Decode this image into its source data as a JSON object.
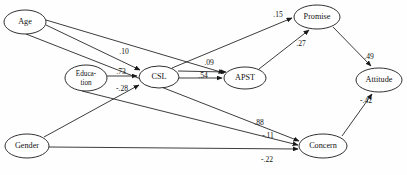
{
  "figure": {
    "type": "path-diagram",
    "caption": ""
  },
  "nodes": [
    {
      "id": "age",
      "label": "Age",
      "label_lines": [
        "Age"
      ],
      "cx": 25,
      "cy": 22,
      "rx": 21,
      "ry": 12
    },
    {
      "id": "education",
      "label": "Education",
      "label_lines": [
        "Educa-",
        "tion"
      ],
      "cx": 86,
      "cy": 78,
      "rx": 21,
      "ry": 13
    },
    {
      "id": "csl",
      "label": "CSL",
      "label_lines": [
        "CSL"
      ],
      "cx": 159,
      "cy": 77,
      "rx": 20,
      "ry": 11
    },
    {
      "id": "apst",
      "label": "APST",
      "label_lines": [
        "APST"
      ],
      "cx": 245,
      "cy": 78,
      "rx": 21,
      "ry": 11
    },
    {
      "id": "promise",
      "label": "Promise",
      "label_lines": [
        "Promise"
      ],
      "cx": 317,
      "cy": 17,
      "rx": 23,
      "ry": 12
    },
    {
      "id": "attitude",
      "label": "Attitude",
      "label_lines": [
        "Attitude"
      ],
      "cx": 379,
      "cy": 80,
      "rx": 23,
      "ry": 12
    },
    {
      "id": "concern",
      "label": "Concern",
      "label_lines": [
        "Concern"
      ],
      "cx": 323,
      "cy": 146,
      "rx": 24,
      "ry": 12
    },
    {
      "id": "gender",
      "label": "Gender",
      "label_lines": [
        "Gender"
      ],
      "cx": 27,
      "cy": 146,
      "rx": 22,
      "ry": 12
    }
  ],
  "edges": [
    {
      "id": "age-csl",
      "from": "Age",
      "to": "CSL",
      "coefficient": ".10",
      "label_x": 124,
      "label_y": 52,
      "x1": 46,
      "y1": 25,
      "x2": 142,
      "y2": 70
    },
    {
      "id": "age-apst",
      "from": "Age",
      "to": "APST",
      "coefficient": "",
      "label_x": 0,
      "label_y": 0,
      "x1": 46,
      "y1": 21,
      "x2": 226,
      "y2": 74
    },
    {
      "id": "age-concern",
      "from": "Age",
      "to": "Concern",
      "coefficient": ".88",
      "label_x": 258,
      "label_y": 123,
      "x1": 27,
      "y1": 34,
      "x2": 300,
      "y2": 142
    },
    {
      "id": "education-csl",
      "from": "Education",
      "to": "CSL",
      "coefficient": ".73",
      "label_x": 121,
      "label_y": 72,
      "x1": 107,
      "y1": 76,
      "x2": 138,
      "y2": 76
    },
    {
      "id": "education-concern",
      "from": "Education",
      "to": "Concern",
      "coefficient": "-.11",
      "label_x": 268,
      "label_y": 136,
      "x1": 86,
      "y1": 91,
      "x2": 299,
      "y2": 146
    },
    {
      "id": "gender-csl",
      "from": "Gender",
      "to": "CSL",
      "coefficient": "-.28",
      "label_x": 122,
      "label_y": 88,
      "x1": 44,
      "y1": 138,
      "x2": 140,
      "y2": 84
    },
    {
      "id": "gender-concern",
      "from": "Gender",
      "to": "Concern",
      "coefficient": "-.22",
      "label_x": 267,
      "label_y": 159,
      "x1": 49,
      "y1": 147,
      "x2": 299,
      "y2": 149
    },
    {
      "id": "csl-apst",
      "from": "CSL",
      "to": "APST",
      "coefficient": ".54",
      "label_x": 203,
      "label_y": 75,
      "x1": 179,
      "y1": 78,
      "x2": 223,
      "y2": 78
    },
    {
      "id": "csl-promise",
      "from": "CSL",
      "to": "Promise",
      "coefficient": ".09",
      "label_x": 209,
      "label_y": 63,
      "x1": 178,
      "y1": 71,
      "x2": 228,
      "y2": 73
    },
    {
      "id": "csl-promise-15",
      "from": "CSL",
      "to": "Promise",
      "coefficient": ".15",
      "label_x": 278,
      "label_y": 15,
      "x1": 176,
      "y1": 70,
      "x2": 293,
      "y2": 18
    },
    {
      "id": "apst-promise",
      "from": "APST",
      "to": "Promise",
      "coefficient": ".27",
      "label_x": 301,
      "label_y": 43,
      "x1": 258,
      "y1": 69,
      "x2": 310,
      "y2": 30
    },
    {
      "id": "promise-attitude",
      "from": "Promise",
      "to": "Attitude",
      "coefficient": ".49",
      "label_x": 369,
      "label_y": 57,
      "x1": 333,
      "y1": 28,
      "x2": 372,
      "y2": 67
    },
    {
      "id": "concern-attitude",
      "from": "Concern",
      "to": "Attitude",
      "coefficient": "-.42",
      "label_x": 366,
      "label_y": 101,
      "x1": 341,
      "y1": 137,
      "x2": 372,
      "y2": 93
    }
  ],
  "edge_labels": {
    "age_csl": ".10",
    "education_csl": ".73",
    "gender_csl": "-.28",
    "csl_apst": ".54",
    "csl_promise": ".09",
    "csl_promise_direct": ".15",
    "apst_promise": ".27",
    "promise_attitude": ".49",
    "concern_attitude": "-.42",
    "age_concern": ".88",
    "education_concern": "-.11",
    "gender_concern": "-.22"
  },
  "node_labels": {
    "age": "Age",
    "education_line1": "Educa-",
    "education_line2": "tion",
    "csl": "CSL",
    "apst": "APST",
    "promise": "Promise",
    "attitude": "Attitude",
    "concern": "Concern",
    "gender": "Gender"
  },
  "colors": {
    "stroke": "#1a1a1a",
    "node_fill": "#ffffff",
    "text": "#111111",
    "background": "#ffffff"
  }
}
